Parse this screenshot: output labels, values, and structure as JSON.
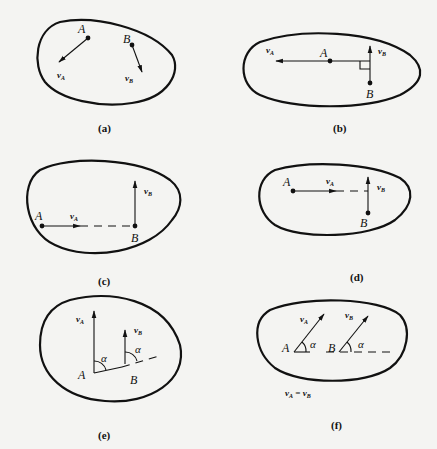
{
  "figure": {
    "panels": [
      {
        "id": "a",
        "caption": "(a)",
        "point_a": "A",
        "point_b": "B",
        "vel_a": "v",
        "vel_a_sub": "A",
        "vel_b": "v",
        "vel_b_sub": "B"
      },
      {
        "id": "b",
        "caption": "(b)",
        "point_a": "A",
        "point_b": "B",
        "vel_a": "v",
        "vel_a_sub": "A",
        "vel_b": "v",
        "vel_b_sub": "B"
      },
      {
        "id": "c",
        "caption": "(c)",
        "point_a": "A",
        "point_b": "B",
        "vel_a": "v",
        "vel_a_sub": "A",
        "vel_b": "v",
        "vel_b_sub": "B"
      },
      {
        "id": "d",
        "caption": "(d)",
        "point_a": "A",
        "point_b": "B",
        "vel_a": "v",
        "vel_a_sub": "A",
        "vel_b": "v",
        "vel_b_sub": "B"
      },
      {
        "id": "e",
        "caption": "(e)",
        "point_a": "A",
        "point_b": "B",
        "vel_a": "v",
        "vel_a_sub": "A",
        "vel_b": "v",
        "vel_b_sub": "B",
        "angle": "α"
      },
      {
        "id": "f",
        "caption": "(f)",
        "point_a": "A",
        "point_b": "B",
        "vel_a": "v",
        "vel_a_sub": "A",
        "vel_b": "v",
        "vel_b_sub": "B",
        "angle": "α",
        "equation": {
          "lhs": "v",
          "lhs_sub": "A",
          "eq": " = ",
          "rhs": "v",
          "rhs_sub": "B"
        }
      }
    ]
  }
}
